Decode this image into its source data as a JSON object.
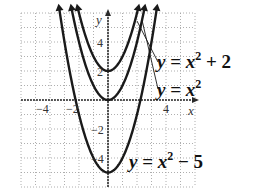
{
  "chart_data": {
    "type": "line",
    "title": "",
    "xlabel": "x",
    "ylabel": "y",
    "xlim": [
      -6,
      6
    ],
    "ylim": [
      -6,
      6
    ],
    "grid": true,
    "x_ticks_labeled": [
      -4,
      -2,
      4
    ],
    "y_ticks_labeled": [
      4,
      2,
      -2,
      -4
    ],
    "series": [
      {
        "name": "y = x^2 + 2",
        "label_text": "y = x² + 2",
        "function": "x^2 + 2",
        "vertex": [
          0,
          2
        ]
      },
      {
        "name": "y = x^2",
        "label_text": "y = x²",
        "function": "x^2",
        "vertex": [
          0,
          0
        ]
      },
      {
        "name": "y = x^2 - 5",
        "label_text": "y = x² − 5",
        "function": "x^2 - 5",
        "vertex": [
          0,
          -5
        ]
      }
    ],
    "legend_position": "inline labels to the right of the curves"
  },
  "ticks": {
    "x_neg4": "−4",
    "x_neg2": "−2",
    "x_pos4": "4",
    "y_pos4": "4",
    "y_pos2": "2",
    "y_neg2": "−2",
    "y_neg4": "−4"
  },
  "axes": {
    "x_name": "x",
    "y_name": "y"
  },
  "labels": {
    "upper": {
      "lhs": "y",
      "eq": " = ",
      "var": "x",
      "exp": "2",
      "rest": " + 2"
    },
    "middle": {
      "lhs": "y",
      "eq": " = ",
      "var": "x",
      "exp": "2",
      "rest": ""
    },
    "lower": {
      "lhs": "y",
      "eq": " = ",
      "var": "x",
      "exp": "2",
      "rest": " − 5"
    }
  },
  "colors": {
    "curve": "#1a1a1a",
    "axis": "#2a2a2a",
    "grid": "#9a9a9a"
  }
}
